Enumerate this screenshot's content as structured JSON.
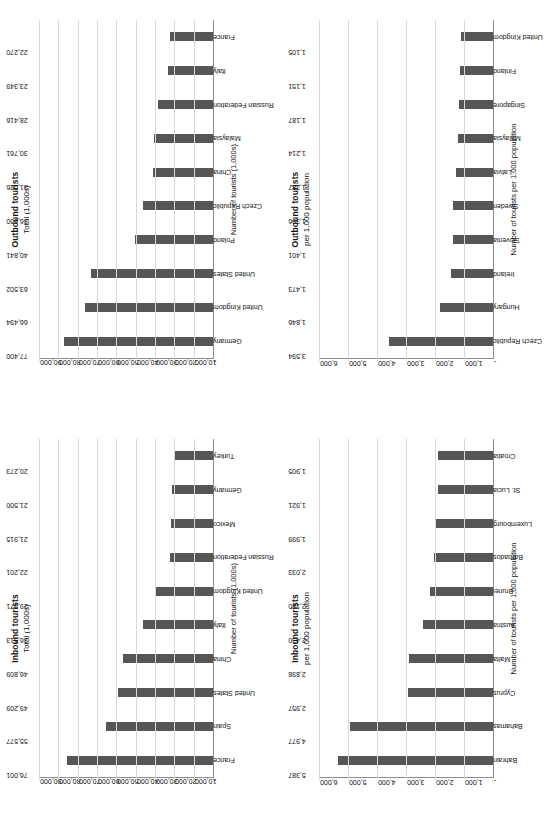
{
  "page": {
    "orientation": "landscape-sheet-rotated-90-ccw",
    "background": "#ffffff",
    "bar_color": "#565656",
    "axis_color": "#8c8c8c"
  },
  "chart_data": [
    {
      "id": "inbound-total",
      "type": "bar",
      "title": "Inbound tourists",
      "subtitle": "Total (1,000s)",
      "xlabel": "",
      "ylabel": "Number of tourists (1,000s)",
      "ylim": [
        0,
        90000
      ],
      "yticks": [
        "-",
        "10,000",
        "20,000",
        "30,000",
        "40,000",
        "50,000",
        "60,000",
        "70,000",
        "80,000",
        "90,000"
      ],
      "ytick_values": [
        0,
        10000,
        20000,
        30000,
        40000,
        50000,
        60000,
        70000,
        80000,
        90000
      ],
      "grid": true,
      "legend": "none",
      "categories": [
        "France",
        "Spain",
        "United States",
        "China",
        "Italy",
        "United Kingdom",
        "Russian Federation",
        "Mexico",
        "Germany",
        "Turkey"
      ],
      "values": [
        76001,
        55577,
        49209,
        46809,
        36513,
        29971,
        22201,
        21915,
        21500,
        20273
      ],
      "labels": [
        "76,001",
        "55,577",
        "49,209",
        "46,809",
        "36,513",
        "29,971",
        "22,201",
        "21,915",
        "21,500",
        "20,273"
      ]
    },
    {
      "id": "outbound-total",
      "type": "bar",
      "title": "Outbound tourists",
      "subtitle": "Total (1,000s)",
      "xlabel": "",
      "ylabel": "Number of tourists (1,000s)",
      "ylim": [
        0,
        90000
      ],
      "yticks": [
        "-",
        "10,000",
        "20,000",
        "30,000",
        "40,000",
        "50,000",
        "60,000",
        "70,000",
        "80,000",
        "90,000"
      ],
      "ytick_values": [
        0,
        10000,
        20000,
        30000,
        40000,
        50000,
        60000,
        70000,
        80000,
        90000
      ],
      "grid": true,
      "legend": "none",
      "categories": [
        "Germany",
        "United Kingdom",
        "United States",
        "Poland",
        "Czech Republic",
        "China",
        "Malaysia",
        "Russian Federation",
        "Italy",
        "France"
      ],
      "values": [
        77400,
        66494,
        63502,
        40841,
        36650,
        31026,
        30761,
        28416,
        23349,
        22270
      ],
      "labels": [
        "77,400",
        "66,494",
        "63,502",
        "40,841",
        "36,650",
        "31,026",
        "30,761",
        "28,416",
        "23,349",
        "22,270"
      ]
    },
    {
      "id": "inbound-per-1000",
      "type": "bar",
      "title": "Inbound tourists",
      "subtitle": "per 1,000 population",
      "xlabel": "",
      "ylabel": "Number of tourists per 1,000 population",
      "ylim": [
        0,
        6000
      ],
      "yticks": [
        "-",
        "1,000",
        "2,000",
        "3,000",
        "4,000",
        "5,000",
        "6,000"
      ],
      "ytick_values": [
        0,
        1000,
        2000,
        3000,
        4000,
        5000,
        6000
      ],
      "grid": true,
      "legend": "none",
      "categories": [
        "Bahrain",
        "Bahamas",
        "Cyprus",
        "Malta",
        "Austria",
        "Brunei",
        "Barbados",
        "Luxembourg",
        "St. Lucia",
        "Croatia"
      ],
      "values": [
        5387,
        4977,
        2957,
        2898,
        2430,
        2180,
        2033,
        1999,
        1921,
        1905
      ],
      "labels": [
        "5,387",
        "4,977",
        "2,957",
        "2,898",
        "2,430",
        "2,180",
        "2,033",
        "1,999",
        "1,921",
        "1,905"
      ]
    },
    {
      "id": "outbound-per-1000",
      "type": "bar",
      "title": "Outbound tourists",
      "subtitle": "per 1,000 population",
      "xlabel": "",
      "ylabel": "Number of tourists per 1,000 population",
      "ylim": [
        0,
        6000
      ],
      "yticks": [
        "-",
        "1,000",
        "2,000",
        "3,000",
        "4,000",
        "5,000",
        "6,000"
      ],
      "ytick_values": [
        0,
        1000,
        2000,
        3000,
        4000,
        5000,
        6000
      ],
      "grid": true,
      "legend": "none",
      "categories": [
        "Czech Republic",
        "Hungary",
        "Ireland",
        "Slovenia",
        "Sweden",
        "Latvia",
        "Malaysia",
        "Singapore",
        "Finland",
        "United Kingdom"
      ],
      "values": [
        3594,
        1846,
        1473,
        1401,
        1396,
        1287,
        1214,
        1187,
        1151,
        1105
      ],
      "labels": [
        "3,594",
        "1,846",
        "1,473",
        "1,401",
        "1,396",
        "1,287",
        "1,214",
        "1,187",
        "1,151",
        "1,105"
      ]
    }
  ]
}
